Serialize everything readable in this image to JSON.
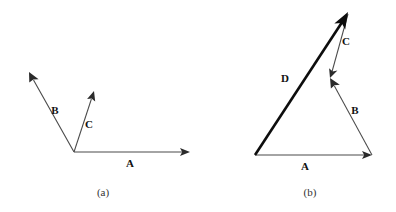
{
  "figure": {
    "title": "",
    "background_color": "#ffffff",
    "line_color": "#4a4a4a",
    "bold_line_color": "#0d0d0d",
    "text_color": "#111111",
    "panels": [
      {
        "caption": "(a)",
        "caption_pos": [
          103,
          196
        ],
        "vectors": [
          {
            "label": "A",
            "label_pos": [
              130,
              167
            ],
            "start": [
              74,
              152
            ],
            "end": [
              190,
              152
            ],
            "style": "thin",
            "arrow": "end"
          },
          {
            "label": "B",
            "label_pos": [
              55,
              114
            ],
            "start": [
              74,
              152
            ],
            "end": [
              29,
              72
            ],
            "style": "thin",
            "arrow": "end"
          },
          {
            "label": "C",
            "label_pos": [
              89,
              128
            ],
            "start": [
              74,
              152
            ],
            "end": [
              94,
              91
            ],
            "style": "thin",
            "arrow": "end"
          }
        ]
      },
      {
        "caption": "(b)",
        "caption_pos": [
          310,
          196
        ],
        "vectors": [
          {
            "label": "A",
            "label_pos": [
              305,
              170
            ],
            "start": [
              255,
              155
            ],
            "end": [
              372,
              155
            ],
            "style": "thin",
            "arrow": "end"
          },
          {
            "label": "B",
            "label_pos": [
              355,
              114
            ],
            "start": [
              372,
              155
            ],
            "end": [
              330,
              78
            ],
            "style": "thin",
            "arrow": "end"
          },
          {
            "label": "C",
            "label_pos": [
              346,
              45
            ],
            "start": [
              330,
              78
            ],
            "end": [
              348,
              14
            ],
            "style": "thin",
            "arrow": "end"
          },
          {
            "label": "D",
            "label_pos": [
              285,
              82
            ],
            "start": [
              255,
              155
            ],
            "end": [
              348,
              12
            ],
            "style": "bold",
            "arrow": "end"
          }
        ]
      }
    ]
  }
}
